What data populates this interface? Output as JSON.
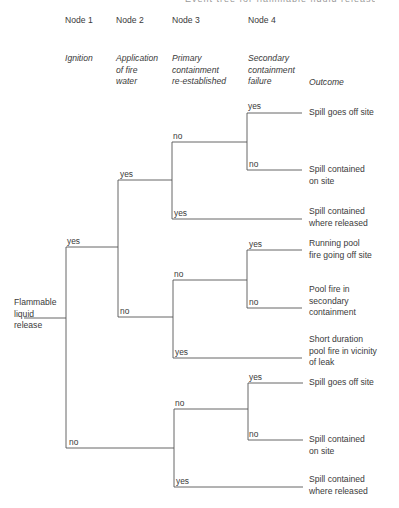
{
  "header_cutoff": "Event tree for flammable liquid release",
  "nodes": [
    {
      "title": "Node 1",
      "event": "Ignition"
    },
    {
      "title": "Node 2",
      "event": "Application of fire water"
    },
    {
      "title": "Node 3",
      "event": "Primary containment re-established"
    },
    {
      "title": "Node 4",
      "event": "Secondary containment failure"
    }
  ],
  "outcome_header": "Outcome",
  "root": "Flammable liquid release",
  "branch_labels": {
    "n1_yes": "yes",
    "n1_no": "no",
    "n2a_yes": "yes",
    "n2a_no": "no",
    "n3a_no": "no",
    "n3a_yes": "yes",
    "n4a_yes": "yes",
    "n4a_no": "no",
    "n3b_no": "no",
    "n3b_yes": "yes",
    "n4b_yes": "yes",
    "n4b_no": "no",
    "n3c_no": "no",
    "n3c_yes": "yes",
    "n4c_yes": "yes",
    "n4c_no": "no"
  },
  "outcomes": [
    "Spill goes off site",
    "Spill contained on site",
    "Spill contained where released",
    "Running pool fire going off site",
    "Pool fire in secondary containment",
    "Short duration pool fire in vicinity of leak",
    "Spill goes off site",
    "Spill contained on site",
    "Spill contained where released"
  ],
  "outcome_lines": [
    [
      "Spill goes off site"
    ],
    [
      "Spill contained",
      "on site"
    ],
    [
      "Spill contained",
      "where released"
    ],
    [
      "Running pool",
      "fire going off site"
    ],
    [
      "Pool fire in",
      "secondary",
      "containment"
    ],
    [
      "Short duration",
      "pool fire in vicinity",
      "of leak"
    ],
    [
      "Spill goes off site"
    ],
    [
      "Spill contained",
      "on site"
    ],
    [
      "Spill contained",
      "where released"
    ]
  ],
  "event_lines": [
    [
      "Ignition"
    ],
    [
      "Application",
      "of fire",
      "water"
    ],
    [
      "Primary",
      "containment",
      "re-established"
    ],
    [
      "Secondary",
      "containment",
      "failure"
    ]
  ],
  "root_lines": [
    "Flammable",
    "liquid",
    "release"
  ]
}
